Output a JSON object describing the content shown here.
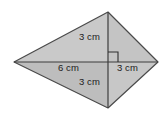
{
  "figure": {
    "name": "kite-with-diagonals",
    "background_color": "#ffffff",
    "outline_color": "#4a4a4a",
    "diagonal_color": "#3d3d3d",
    "right_angle_color": "#2e2e2e",
    "fill_upper_left": "#c9c9c9",
    "fill_upper_right": "#c4c4c4",
    "fill_lower_left": "#bdbdbd",
    "fill_lower_right": "#c7c7c7",
    "vertices": {
      "left": {
        "x": 14,
        "y": 62
      },
      "top": {
        "x": 108,
        "y": 12
      },
      "right": {
        "x": 158,
        "y": 62
      },
      "bottom": {
        "x": 108,
        "y": 108
      }
    },
    "intersection": {
      "x": 108,
      "y": 62
    },
    "labels": {
      "top": "3 cm",
      "right": "3 cm",
      "left": "6 cm",
      "bottom": "3 cm"
    }
  }
}
